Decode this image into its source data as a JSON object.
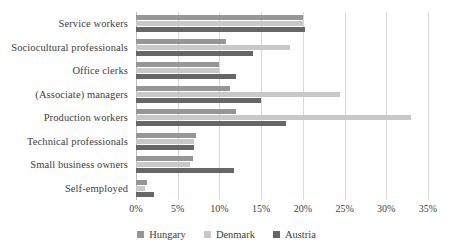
{
  "chart_data": {
    "type": "bar",
    "orientation": "horizontal",
    "title": "",
    "xlabel": "",
    "ylabel": "",
    "categories": [
      "Service workers",
      "Sociocultural professionals",
      "Office clerks",
      "(Associate) managers",
      "Production workers",
      "Technical professionals",
      "Small business owners",
      "Self-employed"
    ],
    "series": [
      {
        "name": "Hungary",
        "color": "#969696",
        "values": [
          20.0,
          10.8,
          10.0,
          11.3,
          12.0,
          7.2,
          6.8,
          1.3
        ]
      },
      {
        "name": "Denmark",
        "color": "#c8c8c8",
        "values": [
          20.0,
          18.5,
          10.0,
          24.5,
          33.0,
          7.0,
          6.5,
          1.1
        ]
      },
      {
        "name": "Austria",
        "color": "#666666",
        "values": [
          20.3,
          14.0,
          12.0,
          15.0,
          18.0,
          7.0,
          11.7,
          2.2
        ]
      }
    ],
    "xticks": [
      "0%",
      "5%",
      "10%",
      "15%",
      "20%",
      "25%",
      "30%",
      "35%"
    ],
    "xtick_values": [
      0,
      5,
      10,
      15,
      20,
      25,
      30,
      35
    ],
    "xlim": [
      0,
      35
    ],
    "grid": true,
    "grid_axis": "x",
    "legend_position": "bottom"
  }
}
